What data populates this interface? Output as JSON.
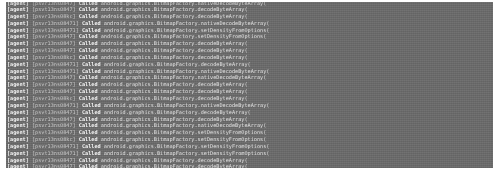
{
  "window": {
    "kind": "terminal-log-output",
    "background_color": "#6b6b6b",
    "text_color": "#e8e8e8",
    "page_background_color": "#ffffff"
  },
  "log": {
    "agent_tag": "[agent]",
    "called_keyword": "Called",
    "class_prefix": "android.graphics.BitmapFactory.",
    "open_paren": "(",
    "device_ids": [
      "[psvr13ns0847]",
      "[psvt13ns0847]",
      "[psvr13ns08kc]",
      "[psvr13ns08471]",
      "[psvt13ns08471]",
      "[psvr13ns0847]"
    ],
    "methods": [
      "nativeDecodeByteArray",
      "decodeByteArray",
      "decodeByteArray",
      "nativeDecodeByteArray",
      "setDensityFromOptions",
      "setDensityFromOptions",
      "decodeByteArray",
      "decodeByteArray",
      "decodeByteArray",
      "decodeByteArray",
      "nativeDecodeByteArray",
      "nativeDecodeByteArray",
      "decodeByteArray",
      "decodeByteArray",
      "decodeByteArray",
      "nativeDecodeByteArray",
      "decodeByteArray",
      "decodeByteArray",
      "nativeDecodeByteArray",
      "setDensityFromOptions",
      "setDensityFromOptions",
      "setDensityFromOptions",
      "setDensityFromOptions",
      "decodeByteArray",
      "decodeByteArray",
      "nativeDecodeByteArray",
      "decodeByteArray",
      "decodeByteArray",
      "nativeDecodeByteArray"
    ],
    "line_count": 25
  }
}
